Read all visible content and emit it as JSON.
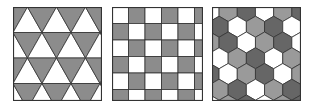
{
  "figure": {
    "panels": [
      {
        "id": "triangular",
        "pattern": "triangular-tiling",
        "colors": {
          "light": "#ffffff",
          "dark": "#8c8c8c",
          "stroke": "#333333"
        }
      },
      {
        "id": "square",
        "pattern": "checkerboard-tiling",
        "colors": {
          "light": "#ffffff",
          "dark": "#8c8c8c",
          "stroke": "#333333"
        }
      },
      {
        "id": "hexagonal",
        "pattern": "hexagonal-tiling",
        "colors": {
          "light": "#ffffff",
          "mid": "#9a9a9a",
          "dark": "#666666",
          "stroke": "#333333"
        }
      }
    ]
  }
}
